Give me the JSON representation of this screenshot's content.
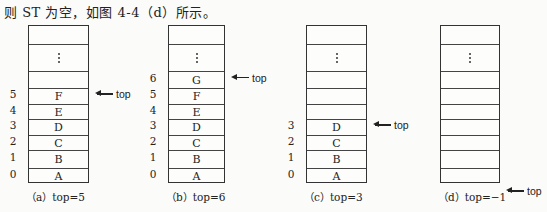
{
  "caption": "则 ST 为空，如图 4-4（d）所示。",
  "pointer_label": "top",
  "panels": [
    {
      "id": "a",
      "subcaption": "（a）top=5",
      "cells": [
        "",
        "⋮",
        "",
        "F",
        "E",
        "D",
        "C",
        "B",
        "A"
      ],
      "indices": [
        "",
        "",
        "",
        "5",
        "4",
        "3",
        "2",
        "1",
        "0"
      ],
      "top_row": 3
    },
    {
      "id": "b",
      "subcaption": "（b）top=6",
      "cells": [
        "",
        "⋮",
        "G",
        "F",
        "E",
        "D",
        "C",
        "B",
        "A"
      ],
      "indices": [
        "",
        "",
        "6",
        "5",
        "4",
        "3",
        "2",
        "1",
        "0"
      ],
      "top_row": 2
    },
    {
      "id": "c",
      "subcaption": "（c）top=3",
      "cells": [
        "",
        "⋮",
        "",
        "",
        "",
        "D",
        "C",
        "B",
        "A"
      ],
      "indices": [
        "",
        "",
        "",
        "",
        "",
        "3",
        "2",
        "1",
        "0"
      ],
      "top_row": 5
    },
    {
      "id": "d",
      "subcaption": "（d）top=−1",
      "cells": [
        "",
        "⋮",
        "",
        "",
        "",
        "",
        "",
        "",
        ""
      ],
      "indices": [
        "",
        "",
        "",
        "",
        "",
        "",
        "",
        "",
        ""
      ],
      "top_row": -1
    }
  ]
}
